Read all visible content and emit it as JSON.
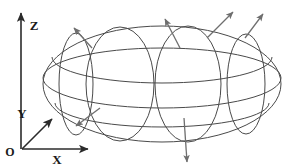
{
  "figure": {
    "background_color": "#ffffff",
    "width": 296,
    "height": 168
  },
  "axes": {
    "origin": {
      "label": "O",
      "x": 22,
      "y": 150,
      "label_x": 10,
      "label_y": 156
    },
    "items": [
      {
        "name": "x-axis",
        "label": "X",
        "x1": 22,
        "y1": 149,
        "x2": 88,
        "y2": 149,
        "label_x": 57,
        "label_y": 164
      },
      {
        "name": "y-axis",
        "label": "Y",
        "x1": 22,
        "y1": 149,
        "x2": 52,
        "y2": 119,
        "label_x": 22,
        "label_y": 118
      },
      {
        "name": "z-axis",
        "label": "Z",
        "x1": 21,
        "y1": 149,
        "x2": 21,
        "y2": 13,
        "label_x": 34,
        "label_y": 30
      }
    ],
    "stroke_color": "#2b2b2b",
    "stroke_width": 1.6
  },
  "ellipsoid": {
    "center_x": 162,
    "center_y": 84,
    "semi_axis_x": 119,
    "semi_axis_y": 58,
    "stroke_color": "#4a4a4a",
    "stroke_width": 1.0,
    "outline_name": "ellipsoid-silhouette",
    "latitude_rings": [
      {
        "name": "latitude-ring-upper",
        "cy": 57,
        "rx": 110,
        "ry": 26
      },
      {
        "name": "equator-ring",
        "cy": 78,
        "rx": 119,
        "ry": 30
      },
      {
        "name": "latitude-ring-lower",
        "cy": 103,
        "rx": 107,
        "ry": 24
      }
    ],
    "meridian_rings": [
      {
        "name": "meridian-ring-1",
        "cx": 76,
        "rx": 17,
        "ry": 51
      },
      {
        "name": "meridian-ring-2",
        "cx": 120,
        "rx": 34,
        "ry": 57
      },
      {
        "name": "meridian-ring-3",
        "cx": 188,
        "rx": 33,
        "ry": 58
      },
      {
        "name": "meridian-ring-4",
        "cx": 246,
        "rx": 19,
        "ry": 50
      }
    ]
  },
  "normal_vectors": {
    "stroke_color": "#6e6e6e",
    "stroke_width": 1.3,
    "arrows": [
      {
        "name": "normal-arrow-upper-left",
        "x1": 92,
        "y1": 48,
        "x2": 74,
        "y2": 28
      },
      {
        "name": "normal-arrow-lower-left",
        "x1": 100,
        "y1": 108,
        "x2": 76,
        "y2": 126
      },
      {
        "name": "normal-arrow-top-center",
        "x1": 180,
        "y1": 48,
        "x2": 165,
        "y2": 19
      },
      {
        "name": "normal-arrow-top-right-a",
        "x1": 207,
        "y1": 38,
        "x2": 233,
        "y2": 12
      },
      {
        "name": "normal-arrow-top-right-b",
        "x1": 245,
        "y1": 38,
        "x2": 263,
        "y2": 14
      },
      {
        "name": "normal-arrow-bottom",
        "x1": 184,
        "y1": 118,
        "x2": 187,
        "y2": 162
      }
    ]
  }
}
